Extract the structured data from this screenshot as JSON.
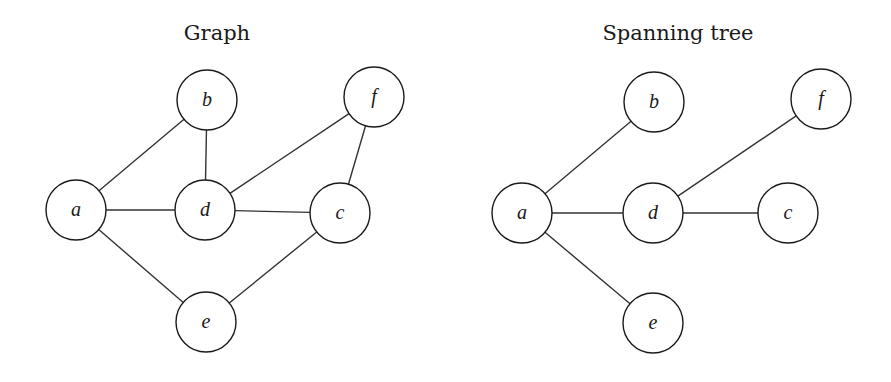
{
  "diagrams": [
    {
      "id": "graph",
      "title": "Graph",
      "title_pos": [
        217,
        40
      ],
      "node_radius": 30,
      "nodes": [
        {
          "id": "a",
          "label": "a",
          "x": 76,
          "y": 210
        },
        {
          "id": "b",
          "label": "b",
          "x": 207,
          "y": 100
        },
        {
          "id": "d",
          "label": "d",
          "x": 205,
          "y": 210
        },
        {
          "id": "c",
          "label": "c",
          "x": 340,
          "y": 213
        },
        {
          "id": "f",
          "label": "f",
          "x": 374,
          "y": 97
        },
        {
          "id": "e",
          "label": "e",
          "x": 206,
          "y": 322
        }
      ],
      "edges": [
        [
          "a",
          "b"
        ],
        [
          "a",
          "d"
        ],
        [
          "a",
          "e"
        ],
        [
          "b",
          "d"
        ],
        [
          "d",
          "f"
        ],
        [
          "d",
          "c"
        ],
        [
          "f",
          "c"
        ],
        [
          "c",
          "e"
        ]
      ]
    },
    {
      "id": "spanning-tree",
      "title": "Spanning tree",
      "title_pos": [
        678,
        40
      ],
      "node_radius": 30,
      "nodes": [
        {
          "id": "a",
          "label": "a",
          "x": 522,
          "y": 213
        },
        {
          "id": "b",
          "label": "b",
          "x": 654,
          "y": 102
        },
        {
          "id": "d",
          "label": "d",
          "x": 653,
          "y": 213
        },
        {
          "id": "c",
          "label": "c",
          "x": 788,
          "y": 213
        },
        {
          "id": "f",
          "label": "f",
          "x": 821,
          "y": 99
        },
        {
          "id": "e",
          "label": "e",
          "x": 653,
          "y": 323
        }
      ],
      "edges": [
        [
          "a",
          "b"
        ],
        [
          "a",
          "d"
        ],
        [
          "a",
          "e"
        ],
        [
          "d",
          "f"
        ],
        [
          "d",
          "c"
        ]
      ]
    }
  ]
}
